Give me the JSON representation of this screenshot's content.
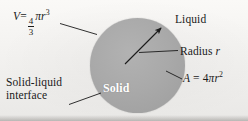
{
  "figure": {
    "background_color": "#f2f1ef",
    "sphere_color": "#a9a9a9",
    "line_color": "#1a1a1a"
  },
  "labels": {
    "volume": {
      "variable": "V",
      "equals": "=",
      "fraction_numerator": "4",
      "fraction_denominator": "3",
      "pi": "π",
      "radius_symbol": "r",
      "exponent": "3",
      "plain_text": "V = 4/3 πr³"
    },
    "area": {
      "variable": "A",
      "equals": "=",
      "coefficient": "4",
      "pi": "π",
      "radius_symbol": "r",
      "exponent": "2",
      "plain_text": "A = 4πr²"
    },
    "liquid": "Liquid",
    "radius": {
      "text": "Radius",
      "symbol": "r"
    },
    "solid": "Solid",
    "interface": {
      "line1": "Solid-liquid",
      "line2": "interface",
      "plain_text": "Solid-liquid interface"
    }
  }
}
